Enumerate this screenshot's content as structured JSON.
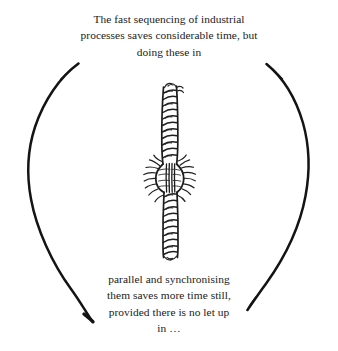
{
  "figure": {
    "kind": "hand-drawn-diagram",
    "background_color": "#ffffff",
    "ink_color": "#141414",
    "width": 338,
    "height": 351
  },
  "caption_top": {
    "lines": [
      "The fast sequencing of industrial",
      "processes saves considerable time, but",
      "doing these in"
    ]
  },
  "caption_bottom": {
    "lines": [
      "parallel and synchronising",
      "them saves more time still,",
      "provided there is no let up",
      "in …"
    ]
  },
  "shapes": {
    "left_arc_label": "left-ellipse-arc",
    "right_arc_label": "right-ellipse-arc",
    "rope_label": "twisted-rope-illustration",
    "splice_label": "rope-splice-knot"
  }
}
